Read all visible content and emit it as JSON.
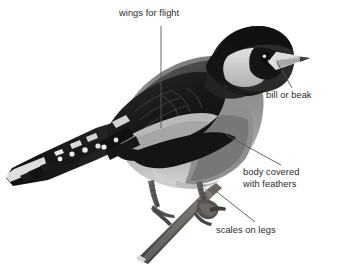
{
  "figure": {
    "background_color": "#ffffff",
    "label_color": "#2b2b2b",
    "leader_line_color": "#555555"
  },
  "labels": [
    {
      "id": "wings",
      "name": "wings-for-flight",
      "text": "wings for flight",
      "lines": [
        "wings for flight"
      ],
      "leader": {
        "x1": 161,
        "y1": 26,
        "x2": 161,
        "y2": 128
      }
    },
    {
      "id": "bill",
      "name": "bill-or-beak",
      "text": "bill or beak",
      "lines": [
        "bill or beak"
      ],
      "leader": {
        "x1": 277,
        "y1": 62,
        "x2": 292,
        "y2": 88
      }
    },
    {
      "id": "body",
      "name": "body-covered-with-feathers",
      "text": "body covered with feathers",
      "lines": [
        "body covered",
        "with feathers"
      ],
      "leader": {
        "x1": 226,
        "y1": 135,
        "x2": 281,
        "y2": 165
      }
    },
    {
      "id": "scales",
      "name": "scales-on-legs",
      "text": "scales on legs",
      "lines": [
        "scales on legs"
      ],
      "leader": {
        "x1": 212,
        "y1": 188,
        "x2": 255,
        "y2": 222
      }
    }
  ],
  "bird_parts": {
    "crown": "black cap",
    "face": "black eye mask with pale cheek patch",
    "beak": "pale conical bill with dark tip",
    "mantle": "dark grey back",
    "wing": "black wing with pale wing bar and white tipped primaries",
    "breast": "mid grey breast and flank",
    "belly": "pale underside",
    "tail": "black forked tail with white spots",
    "legs": "grey scaly legs gripping a twig",
    "perch": "diagonal grey-brown branch"
  },
  "palette": {
    "black": "#1a1a1a",
    "dark_grey": "#3d3d3d",
    "mid_grey": "#6e6e6e",
    "light_grey": "#a8a8a8",
    "pale": "#d6d6d6",
    "near_white": "#efefef",
    "branch": "#5f5b57"
  }
}
